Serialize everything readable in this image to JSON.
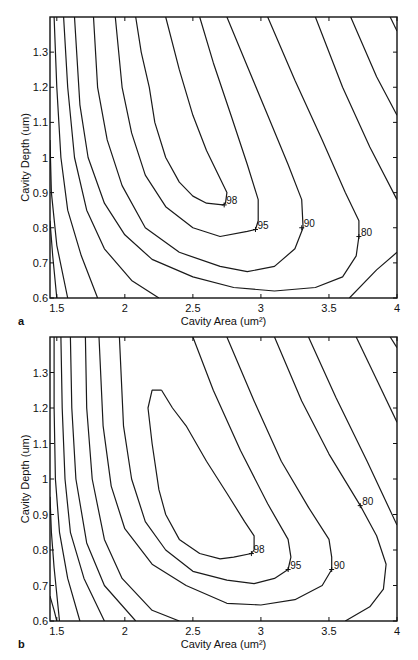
{
  "chart_data": [
    {
      "id": "a",
      "type": "contour",
      "panel_label": "a",
      "title": "",
      "xlabel": "Cavity Area  (um²)",
      "ylabel": "Cavity Depth (um)",
      "xlim": [
        1.45,
        4.0
      ],
      "ylim": [
        0.6,
        1.4
      ],
      "xticks": [
        1.5,
        2,
        2.5,
        3,
        3.5,
        4
      ],
      "xtick_labels": [
        "1.5",
        "2",
        "2.5",
        "3",
        "3.5",
        "4"
      ],
      "yticks": [
        0.6,
        0.7,
        0.8,
        0.9,
        1.0,
        1.1,
        1.2,
        1.3
      ],
      "ytick_labels": [
        "0.6",
        "0.7",
        "0.8",
        "0.9",
        "1",
        "1.1",
        "1.2",
        "1.3"
      ],
      "grid": false,
      "contour_labels": [
        {
          "text": "98",
          "x": 2.73,
          "y": 0.865
        },
        {
          "text": "95",
          "x": 2.96,
          "y": 0.795
        },
        {
          "text": "90",
          "x": 3.3,
          "y": 0.8
        },
        {
          "text": "80",
          "x": 3.72,
          "y": 0.775
        }
      ],
      "contours": [
        {
          "level": 98,
          "points": [
            [
              2.3,
              1.4
            ],
            [
              2.4,
              1.25
            ],
            [
              2.5,
              1.12
            ],
            [
              2.6,
              1.02
            ],
            [
              2.7,
              0.94
            ],
            [
              2.75,
              0.9
            ],
            [
              2.74,
              0.87
            ],
            [
              2.72,
              0.865
            ],
            [
              2.6,
              0.87
            ],
            [
              2.5,
              0.89
            ],
            [
              2.4,
              0.93
            ],
            [
              2.3,
              1.0
            ],
            [
              2.22,
              1.1
            ],
            [
              2.18,
              1.2
            ],
            [
              2.12,
              1.3
            ],
            [
              2.08,
              1.4
            ]
          ]
        },
        {
          "level": 95,
          "points": [
            [
              2.55,
              1.4
            ],
            [
              2.65,
              1.27
            ],
            [
              2.78,
              1.12
            ],
            [
              2.9,
              0.98
            ],
            [
              2.98,
              0.88
            ],
            [
              2.98,
              0.82
            ],
            [
              2.96,
              0.795
            ],
            [
              2.9,
              0.79
            ],
            [
              2.7,
              0.775
            ],
            [
              2.5,
              0.8
            ],
            [
              2.3,
              0.86
            ],
            [
              2.15,
              0.95
            ],
            [
              2.05,
              1.07
            ],
            [
              1.98,
              1.2
            ],
            [
              1.93,
              1.4
            ]
          ]
        },
        {
          "level": 90,
          "points": [
            [
              2.75,
              1.4
            ],
            [
              2.9,
              1.26
            ],
            [
              3.05,
              1.12
            ],
            [
              3.2,
              0.98
            ],
            [
              3.3,
              0.88
            ],
            [
              3.31,
              0.8
            ],
            [
              3.25,
              0.74
            ],
            [
              3.1,
              0.69
            ],
            [
              2.9,
              0.675
            ],
            [
              2.7,
              0.69
            ],
            [
              2.4,
              0.73
            ],
            [
              2.15,
              0.8
            ],
            [
              1.98,
              0.92
            ],
            [
              1.87,
              1.05
            ],
            [
              1.8,
              1.2
            ],
            [
              1.77,
              1.4
            ]
          ]
        },
        {
          "level": 80,
          "points": [
            [
              3.05,
              1.4
            ],
            [
              3.25,
              1.22
            ],
            [
              3.45,
              1.05
            ],
            [
              3.62,
              0.9
            ],
            [
              3.72,
              0.82
            ],
            [
              3.72,
              0.775
            ],
            [
              3.7,
              0.72
            ],
            [
              3.6,
              0.66
            ],
            [
              3.4,
              0.63
            ],
            [
              3.1,
              0.62
            ],
            [
              2.8,
              0.63
            ],
            [
              2.5,
              0.66
            ],
            [
              2.2,
              0.71
            ],
            [
              2.0,
              0.78
            ],
            [
              1.85,
              0.87
            ],
            [
              1.73,
              1.0
            ],
            [
              1.67,
              1.15
            ],
            [
              1.63,
              1.4
            ]
          ]
        },
        {
          "level": 70,
          "points": [
            [
              3.4,
              1.4
            ],
            [
              3.6,
              1.2
            ],
            [
              3.8,
              1.03
            ],
            [
              4.0,
              0.88
            ]
          ]
        },
        {
          "level": 70,
          "points": [
            [
              1.55,
              1.4
            ],
            [
              1.58,
              1.2
            ],
            [
              1.63,
              1.0
            ],
            [
              1.72,
              0.85
            ],
            [
              1.85,
              0.74
            ],
            [
              2.05,
              0.65
            ],
            [
              2.25,
              0.6
            ]
          ]
        },
        {
          "level": 70,
          "points": [
            [
              3.65,
              0.6
            ],
            [
              3.85,
              0.68
            ],
            [
              4.0,
              0.73
            ]
          ]
        },
        {
          "level": 60,
          "points": [
            [
              3.66,
              1.4
            ],
            [
              3.85,
              1.23
            ],
            [
              4.0,
              1.12
            ]
          ]
        },
        {
          "level": 60,
          "points": [
            [
              1.48,
              1.4
            ],
            [
              1.5,
              1.2
            ],
            [
              1.53,
              1.0
            ],
            [
              1.58,
              0.85
            ],
            [
              1.68,
              0.72
            ],
            [
              1.8,
              0.6
            ]
          ]
        },
        {
          "level": 50,
          "points": [
            [
              3.95,
              1.4
            ],
            [
              4.0,
              1.36
            ]
          ]
        },
        {
          "level": 50,
          "points": [
            [
              1.45,
              1.05
            ],
            [
              1.46,
              0.9
            ],
            [
              1.5,
              0.75
            ],
            [
              1.58,
              0.6
            ]
          ]
        },
        {
          "level": 40,
          "points": [
            [
              1.45,
              0.82
            ],
            [
              1.47,
              0.72
            ],
            [
              1.5,
              0.6
            ]
          ]
        }
      ]
    },
    {
      "id": "b",
      "type": "contour",
      "panel_label": "b",
      "title": "",
      "xlabel": "Cavity Area (um²)",
      "ylabel": "Cavity Depth (um)",
      "xlim": [
        1.45,
        4.0
      ],
      "ylim": [
        0.6,
        1.4
      ],
      "xticks": [
        1.5,
        2,
        2.5,
        3,
        3.5,
        4
      ],
      "xtick_labels": [
        "1.5",
        "2",
        "2.5",
        "3",
        "3.5",
        "4"
      ],
      "yticks": [
        0.6,
        0.7,
        0.8,
        0.9,
        1.0,
        1.1,
        1.2,
        1.3
      ],
      "ytick_labels": [
        "0.6",
        "0.7",
        "0.8",
        "0.9",
        "1",
        "1.1",
        "1.2",
        "1.3"
      ],
      "grid": false,
      "contour_labels": [
        {
          "text": "98",
          "x": 2.93,
          "y": 0.79
        },
        {
          "text": "95",
          "x": 3.2,
          "y": 0.745
        },
        {
          "text": "90",
          "x": 3.52,
          "y": 0.745
        },
        {
          "text": "80",
          "x": 3.73,
          "y": 0.925
        }
      ],
      "contours": [
        {
          "level": 98,
          "points": [
            [
              2.27,
              1.25
            ],
            [
              2.35,
              1.2
            ],
            [
              2.45,
              1.15
            ],
            [
              2.6,
              1.05
            ],
            [
              2.75,
              0.96
            ],
            [
              2.88,
              0.88
            ],
            [
              2.95,
              0.84
            ],
            [
              2.95,
              0.8
            ],
            [
              2.93,
              0.79
            ],
            [
              2.8,
              0.78
            ],
            [
              2.7,
              0.775
            ],
            [
              2.55,
              0.79
            ],
            [
              2.4,
              0.83
            ],
            [
              2.3,
              0.9
            ],
            [
              2.25,
              0.97
            ],
            [
              2.2,
              1.1
            ],
            [
              2.17,
              1.2
            ],
            [
              2.2,
              1.25
            ],
            [
              2.27,
              1.25
            ]
          ]
        },
        {
          "level": 95,
          "points": [
            [
              2.5,
              1.4
            ],
            [
              2.65,
              1.25
            ],
            [
              2.85,
              1.08
            ],
            [
              3.05,
              0.93
            ],
            [
              3.2,
              0.83
            ],
            [
              3.22,
              0.78
            ],
            [
              3.2,
              0.745
            ],
            [
              3.1,
              0.72
            ],
            [
              2.95,
              0.705
            ],
            [
              2.75,
              0.715
            ],
            [
              2.5,
              0.74
            ],
            [
              2.3,
              0.8
            ],
            [
              2.15,
              0.88
            ],
            [
              2.05,
              1.0
            ],
            [
              1.99,
              1.15
            ],
            [
              1.96,
              1.4
            ]
          ]
        },
        {
          "level": 90,
          "points": [
            [
              2.75,
              1.4
            ],
            [
              2.95,
              1.22
            ],
            [
              3.15,
              1.05
            ],
            [
              3.35,
              0.92
            ],
            [
              3.5,
              0.83
            ],
            [
              3.52,
              0.78
            ],
            [
              3.52,
              0.745
            ],
            [
              3.45,
              0.7
            ],
            [
              3.25,
              0.66
            ],
            [
              3.0,
              0.645
            ],
            [
              2.75,
              0.65
            ],
            [
              2.45,
              0.7
            ],
            [
              2.2,
              0.76
            ],
            [
              2.0,
              0.86
            ],
            [
              1.9,
              0.98
            ],
            [
              1.84,
              1.15
            ],
            [
              1.81,
              1.4
            ]
          ]
        },
        {
          "level": 80,
          "points": [
            [
              3.1,
              1.4
            ],
            [
              3.3,
              1.22
            ],
            [
              3.5,
              1.07
            ],
            [
              3.73,
              0.925
            ],
            [
              3.85,
              0.84
            ],
            [
              3.92,
              0.76
            ],
            [
              3.9,
              0.69
            ],
            [
              3.8,
              0.64
            ],
            [
              3.62,
              0.6
            ]
          ]
        },
        {
          "level": 80,
          "points": [
            [
              1.71,
              1.4
            ],
            [
              1.72,
              1.2
            ],
            [
              1.76,
              1.0
            ],
            [
              1.85,
              0.83
            ],
            [
              1.98,
              0.72
            ],
            [
              2.2,
              0.63
            ],
            [
              2.4,
              0.6
            ]
          ]
        },
        {
          "level": 70,
          "points": [
            [
              3.35,
              1.4
            ],
            [
              3.55,
              1.23
            ],
            [
              3.78,
              1.05
            ],
            [
              4.0,
              0.87
            ]
          ]
        },
        {
          "level": 70,
          "points": [
            [
              1.6,
              1.4
            ],
            [
              1.61,
              1.2
            ],
            [
              1.64,
              1.0
            ],
            [
              1.72,
              0.82
            ],
            [
              1.85,
              0.7
            ],
            [
              2.08,
              0.6
            ]
          ]
        },
        {
          "level": 60,
          "points": [
            [
              3.7,
              1.4
            ],
            [
              3.85,
              1.28
            ],
            [
              4.0,
              1.16
            ]
          ]
        },
        {
          "level": 60,
          "points": [
            [
              1.53,
              1.4
            ],
            [
              1.54,
              1.2
            ],
            [
              1.56,
              1.0
            ],
            [
              1.6,
              0.85
            ],
            [
              1.7,
              0.72
            ],
            [
              1.85,
              0.6
            ]
          ]
        },
        {
          "level": 50,
          "points": [
            [
              3.95,
              1.4
            ],
            [
              4.0,
              1.37
            ]
          ]
        },
        {
          "level": 50,
          "points": [
            [
              1.48,
              1.4
            ],
            [
              1.48,
              1.2
            ],
            [
              1.49,
              1.0
            ],
            [
              1.52,
              0.85
            ],
            [
              1.58,
              0.72
            ],
            [
              1.67,
              0.6
            ]
          ]
        },
        {
          "level": 40,
          "points": [
            [
              1.45,
              0.95
            ],
            [
              1.46,
              0.85
            ],
            [
              1.48,
              0.75
            ],
            [
              1.52,
              0.6
            ]
          ]
        },
        {
          "level": 30,
          "points": [
            [
              1.45,
              0.67
            ],
            [
              1.48,
              0.63
            ],
            [
              1.5,
              0.6
            ]
          ]
        }
      ]
    }
  ]
}
